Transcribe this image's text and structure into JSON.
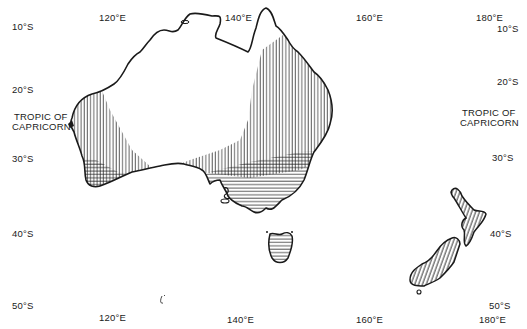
{
  "map": {
    "region": "Australia and New Zealand",
    "longitude_labels_top": [
      "120°E",
      "140°E",
      "160°E",
      "180°E"
    ],
    "longitude_labels_bottom": [
      "120°E",
      "140°E",
      "160°E",
      "180°E"
    ],
    "latitude_labels_left": [
      "10°S",
      "20°S",
      "30°S",
      "40°S",
      "50°S"
    ],
    "latitude_labels_right": [
      "10°S",
      "20°S",
      "30°S",
      "40°S",
      "50°S"
    ],
    "tropic_label_left": [
      "TROPIC OF",
      "CAPRICORN"
    ],
    "tropic_label_right": [
      "TROPIC OF",
      "CAPRICORN"
    ],
    "hatch": {
      "vertical": "vertical-line shading (western, eastern and north-eastern regions, New Zealand diagonal)",
      "horizontal": "horizontal-line shading (south-west corner, south-east corner, Tasmania)"
    },
    "colors": {
      "ink": "#1a1a1a",
      "background": "#ffffff"
    }
  }
}
